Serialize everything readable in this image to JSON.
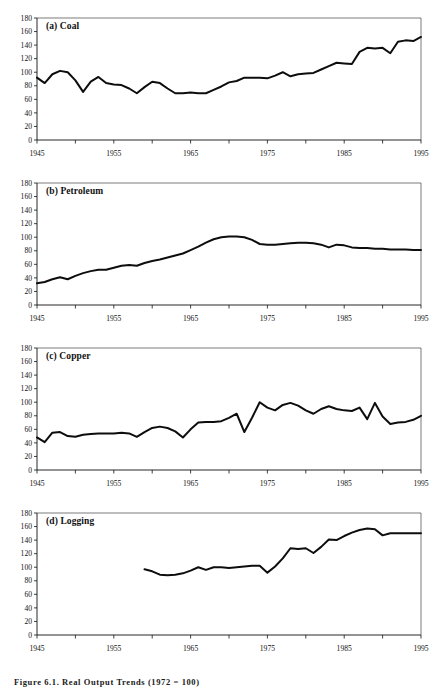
{
  "figure": {
    "caption": "Figure 6.1. Real Output Trends (1972 = 100)",
    "panels_count": 4
  },
  "axes": {
    "y_ticks": [
      0,
      20,
      40,
      60,
      80,
      100,
      120,
      140,
      160,
      180
    ],
    "y_tick_labels": [
      "0",
      "20",
      "40",
      "60",
      "80",
      "100",
      "120",
      "140",
      "160",
      "180"
    ],
    "x_ticks": [
      1945,
      1950,
      1955,
      1960,
      1965,
      1970,
      1975,
      1980,
      1985,
      1990,
      1995
    ],
    "x_tick_labels_shown": [
      "1945",
      "1955",
      "1965",
      "1975",
      "1985",
      "1995"
    ],
    "x_labeled_years": [
      1945,
      1955,
      1965,
      1975,
      1985,
      1995
    ],
    "xlim": [
      1945,
      1995
    ],
    "ylim": [
      0,
      180
    ],
    "line_color": "#0d0d0d",
    "axis_color": "#111111"
  },
  "chart_data": [
    {
      "type": "line",
      "panel": "a",
      "title": "(a) Coal",
      "xlabel": "",
      "ylabel": "",
      "xlim": [
        1945,
        1995
      ],
      "ylim": [
        0,
        180
      ],
      "grid": false,
      "legend": "none",
      "x": [
        1945,
        1946,
        1947,
        1948,
        1949,
        1950,
        1951,
        1952,
        1953,
        1954,
        1955,
        1956,
        1957,
        1958,
        1959,
        1960,
        1961,
        1962,
        1963,
        1964,
        1965,
        1966,
        1967,
        1968,
        1969,
        1970,
        1971,
        1972,
        1973,
        1974,
        1975,
        1976,
        1977,
        1978,
        1979,
        1980,
        1981,
        1982,
        1983,
        1984,
        1985,
        1986,
        1987,
        1988,
        1989,
        1990,
        1991,
        1992,
        1993,
        1994,
        1995
      ],
      "values": [
        92,
        84,
        97,
        102,
        100,
        88,
        71,
        86,
        93,
        84,
        82,
        81,
        76,
        69,
        78,
        86,
        84,
        76,
        69,
        69,
        70,
        69,
        69,
        74,
        79,
        85,
        87,
        92,
        92,
        92,
        91,
        95,
        100,
        94,
        97,
        98,
        99,
        104,
        109,
        114,
        113,
        112,
        130,
        136,
        135,
        136,
        128,
        145,
        147,
        146,
        152,
        158,
        163,
        168,
        163,
        162,
        157,
        168,
        168
      ]
    },
    {
      "type": "line",
      "panel": "b",
      "title": "(b) Petroleum",
      "xlabel": "",
      "ylabel": "",
      "xlim": [
        1945,
        1995
      ],
      "ylim": [
        0,
        180
      ],
      "grid": false,
      "legend": "none",
      "x": [
        1945,
        1946,
        1947,
        1948,
        1949,
        1950,
        1951,
        1952,
        1953,
        1954,
        1955,
        1956,
        1957,
        1958,
        1959,
        1960,
        1961,
        1962,
        1963,
        1964,
        1965,
        1966,
        1967,
        1968,
        1969,
        1970,
        1971,
        1972,
        1973,
        1974,
        1975,
        1976,
        1977,
        1978,
        1979,
        1980,
        1981,
        1982,
        1983,
        1984,
        1985,
        1986,
        1987,
        1988,
        1989,
        1990,
        1991,
        1992,
        1993,
        1994,
        1995
      ],
      "values": [
        32,
        34,
        38,
        41,
        38,
        43,
        47,
        50,
        52,
        52,
        55,
        58,
        59,
        58,
        62,
        65,
        67,
        70,
        73,
        76,
        81,
        86,
        92,
        97,
        100,
        101,
        101,
        100,
        96,
        90,
        89,
        89,
        90,
        91,
        92,
        92,
        91,
        89,
        85,
        89,
        88,
        85,
        84,
        84,
        83,
        83,
        82,
        82,
        82,
        81,
        81
      ]
    },
    {
      "type": "line",
      "panel": "c",
      "title": "(c) Copper",
      "xlabel": "",
      "ylabel": "",
      "xlim": [
        1945,
        1995
      ],
      "ylim": [
        0,
        180
      ],
      "grid": false,
      "legend": "none",
      "x": [
        1945,
        1946,
        1947,
        1948,
        1949,
        1950,
        1951,
        1952,
        1953,
        1954,
        1955,
        1956,
        1957,
        1958,
        1959,
        1960,
        1961,
        1962,
        1963,
        1964,
        1965,
        1966,
        1967,
        1968,
        1969,
        1970,
        1971,
        1972,
        1973,
        1974,
        1975,
        1976,
        1977,
        1978,
        1979,
        1980,
        1981,
        1982,
        1983,
        1984,
        1985,
        1986,
        1987,
        1988,
        1989,
        1990,
        1991,
        1992,
        1993,
        1994,
        1995
      ],
      "values": [
        48,
        41,
        55,
        56,
        50,
        49,
        52,
        53,
        54,
        54,
        54,
        55,
        54,
        49,
        56,
        62,
        64,
        62,
        57,
        48,
        60,
        70,
        71,
        71,
        72,
        77,
        83,
        56,
        77,
        100,
        92,
        88,
        96,
        99,
        95,
        88,
        83,
        90,
        94,
        90,
        88,
        87,
        92,
        75,
        99,
        79,
        68,
        70,
        71,
        74,
        80,
        88,
        95,
        104,
        112,
        116,
        118,
        120
      ]
    },
    {
      "type": "line",
      "panel": "d",
      "title": "(d) Logging",
      "xlabel": "",
      "ylabel": "",
      "xlim": [
        1945,
        1995
      ],
      "ylim": [
        0,
        180
      ],
      "grid": false,
      "legend": "none",
      "x": [
        1959,
        1960,
        1961,
        1962,
        1963,
        1964,
        1965,
        1966,
        1967,
        1968,
        1969,
        1970,
        1971,
        1972,
        1973,
        1974,
        1975,
        1976,
        1977,
        1978,
        1979,
        1980,
        1981,
        1982,
        1983,
        1984,
        1985,
        1986,
        1987,
        1988,
        1989,
        1990,
        1991,
        1992,
        1993,
        1994,
        1995
      ],
      "values": [
        97,
        94,
        89,
        88,
        89,
        91,
        95,
        100,
        96,
        100,
        100,
        99,
        100,
        101,
        102,
        102,
        92,
        101,
        113,
        128,
        127,
        128,
        121,
        130,
        141,
        140,
        146,
        151,
        155,
        157,
        156,
        147,
        150,
        150,
        150,
        150,
        150
      ]
    }
  ]
}
